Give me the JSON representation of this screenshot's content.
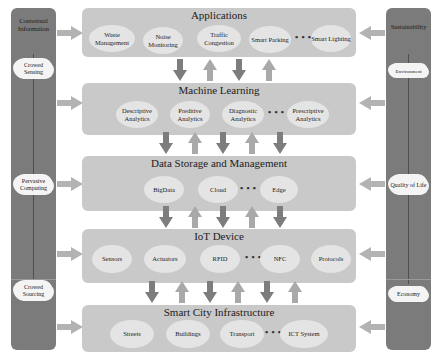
{
  "left_pillar": {
    "title": "Contextual Information",
    "clouds": [
      "Crowed Sensing",
      "Pervasive Computing",
      "Crowed Sourcing"
    ]
  },
  "right_pillar": {
    "title": "Sustainability",
    "clouds": [
      "Environment",
      "Quality of Life",
      "Economy"
    ]
  },
  "layers": [
    {
      "title": "Applications",
      "items": [
        "Waste Management",
        "Noise Monitoring",
        "Traffic Congestion",
        "Smart Parking",
        "Smart Lighting"
      ],
      "ellipsis": "• • •"
    },
    {
      "title": "Machine Learning",
      "items": [
        "Descriptive Analytics",
        "Preditive Analytics",
        "Diagnostic Analytics",
        "Prescriptive Analytics"
      ],
      "ellipsis": "• • •"
    },
    {
      "title": "Data Storage and Management",
      "items": [
        "BigData",
        "Cloud",
        "Edge"
      ],
      "ellipsis": "• • •"
    },
    {
      "title": "IoT Device",
      "items": [
        "Sensors",
        "Actuators",
        "RFID",
        "NFC",
        "Protocols"
      ],
      "ellipsis": "• • •"
    },
    {
      "title": "Smart City Infrastructure",
      "items": [
        "Streets",
        "Buildings",
        "Transport",
        "ICT System"
      ],
      "ellipsis": "• • •"
    }
  ],
  "colors": {
    "pillar": "#7b7b7b",
    "layer": "#c9c9c9",
    "ellipse": "#e4e4e4",
    "arrow_down": "#7d7d7d",
    "arrow_up": "#a9a9a9",
    "side_arrow": "#b3b3b3"
  }
}
